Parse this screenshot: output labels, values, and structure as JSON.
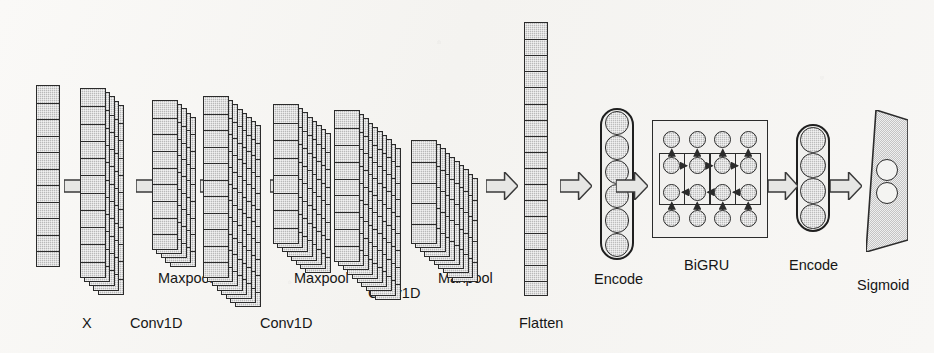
{
  "figure": {
    "background_color": "#f7f6f4",
    "ink_color": "#2b2b2b",
    "fill_color": "#b9b9b9",
    "arrow_fill": "#e2e2e2"
  },
  "labels": {
    "input": "X",
    "conv1": "Conv1D",
    "pool1": "Maxpool",
    "conv2": "Conv1D",
    "pool2": "Maxpool",
    "conv3": "Conv1D",
    "pool3": "Maxpool",
    "flatten": "Flatten",
    "encode1": "Encode",
    "bigru": "BiGRU",
    "encode2": "Encode",
    "sigmoid": "Sigmoid"
  },
  "layers": [
    {
      "id": "input",
      "name": "X",
      "kind": "column",
      "x": 36,
      "y": 85,
      "width": 24,
      "height": 182,
      "cells": 11,
      "depth": 1,
      "label_x": 82,
      "label_y": 316
    },
    {
      "id": "conv1",
      "name": "Conv1D",
      "kind": "stack",
      "x": 98,
      "y": 88,
      "width": 26,
      "height": 190,
      "cells": 11,
      "depth": 5,
      "label_x": 130,
      "label_y": 316
    },
    {
      "id": "pool1",
      "name": "Maxpool",
      "kind": "stack",
      "x": 170,
      "y": 100,
      "width": 26,
      "height": 150,
      "cells": 9,
      "depth": 5,
      "label_x": 158,
      "label_y": 271
    },
    {
      "id": "conv2",
      "name": "Conv1D",
      "kind": "stack",
      "x": 235,
      "y": 96,
      "width": 26,
      "height": 182,
      "cells": 11,
      "depth": 8,
      "label_x": 260,
      "label_y": 316
    },
    {
      "id": "pool2",
      "name": "Maxpool",
      "kind": "stack",
      "x": 305,
      "y": 104,
      "width": 26,
      "height": 140,
      "cells": 8,
      "depth": 8,
      "label_x": 294,
      "label_y": 271
    },
    {
      "id": "conv3",
      "name": "Conv1D",
      "kind": "stack",
      "x": 375,
      "y": 110,
      "width": 26,
      "height": 152,
      "cells": 9,
      "depth": 10,
      "label_x": 368,
      "label_y": 286
    },
    {
      "id": "pool3",
      "name": "Maxpool",
      "kind": "stack",
      "x": 452,
      "y": 140,
      "width": 26,
      "height": 104,
      "cells": 5,
      "depth": 10,
      "label_x": 438,
      "label_y": 271
    },
    {
      "id": "flatten",
      "name": "Flatten",
      "kind": "column",
      "x": 524,
      "y": 22,
      "width": 24,
      "height": 274,
      "cells": 17,
      "depth": 1,
      "label_x": 519,
      "label_y": 316
    },
    {
      "id": "encode1",
      "name": "Encode",
      "kind": "encode",
      "x": 600,
      "y": 108,
      "width": 34,
      "height": 152,
      "nodes": 6,
      "label_x": 594,
      "label_y": 272
    },
    {
      "id": "bigru",
      "name": "BiGRU",
      "kind": "bigru",
      "x": 652,
      "y": 120,
      "width": 116,
      "height": 118,
      "columns": 4,
      "rows": 4,
      "label_x": 684,
      "label_y": 258
    },
    {
      "id": "encode2",
      "name": "Encode",
      "kind": "encode",
      "x": 796,
      "y": 124,
      "width": 34,
      "height": 108,
      "nodes": 4,
      "label_x": 789,
      "label_y": 258
    },
    {
      "id": "sigmoid",
      "name": "Sigmoid",
      "kind": "trapezoid",
      "x": 866,
      "y": 110,
      "width": 42,
      "height": 142,
      "nodes": 2,
      "label_x": 857,
      "label_y": 278
    }
  ],
  "arrows": [
    {
      "id": "a1",
      "from": "input",
      "to": "conv1",
      "x": 64,
      "y": 172,
      "width": 32,
      "height": 28
    },
    {
      "id": "a2",
      "from": "conv1",
      "to": "pool1",
      "x": 136,
      "y": 172,
      "width": 32,
      "height": 28
    },
    {
      "id": "a3",
      "from": "pool1",
      "to": "conv2",
      "x": 200,
      "y": 172,
      "width": 32,
      "height": 28
    },
    {
      "id": "a4",
      "from": "conv2",
      "to": "pool2",
      "x": 270,
      "y": 172,
      "width": 32,
      "height": 28
    },
    {
      "id": "a5",
      "from": "pool2",
      "to": "conv3",
      "x": 340,
      "y": 172,
      "width": 32,
      "height": 28
    },
    {
      "id": "a6",
      "from": "conv3",
      "to": "pool3",
      "x": 414,
      "y": 172,
      "width": 32,
      "height": 28
    },
    {
      "id": "a7",
      "from": "pool3",
      "to": "flatten",
      "x": 486,
      "y": 172,
      "width": 32,
      "height": 28
    },
    {
      "id": "a8",
      "from": "flatten",
      "to": "encode1",
      "x": 560,
      "y": 172,
      "width": 32,
      "height": 28
    },
    {
      "id": "a9",
      "from": "encode1",
      "to": "bigru",
      "x": 616,
      "y": 172,
      "width": 32,
      "height": 28
    },
    {
      "id": "a10",
      "from": "bigru",
      "to": "encode2",
      "x": 768,
      "y": 172,
      "width": 30,
      "height": 28
    },
    {
      "id": "a11",
      "from": "encode2",
      "to": "sigmoid",
      "x": 830,
      "y": 172,
      "width": 32,
      "height": 28
    }
  ]
}
